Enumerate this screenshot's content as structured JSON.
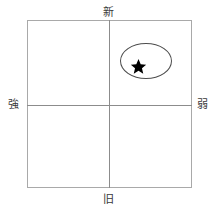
{
  "diagram": {
    "type": "2x2-positioning-matrix",
    "axes": {
      "vertical": {
        "top_label": "新",
        "bottom_label": "旧"
      },
      "horizontal": {
        "left_label": "強",
        "right_label": "弱"
      }
    },
    "markers": [
      {
        "name": "star-marker",
        "glyph": "★",
        "quadrant": "upper-right",
        "color": "#000000"
      }
    ],
    "regions": [
      {
        "name": "highlight-ellipse",
        "shape": "ellipse",
        "quadrant": "upper-right",
        "stroke": "#4d4d4d"
      }
    ],
    "colors": {
      "frame": "#a9a9a9",
      "axis": "#8c8c8c",
      "background": "#ffffff",
      "label_text": "#3a3a3a",
      "marker": "#000000"
    }
  }
}
